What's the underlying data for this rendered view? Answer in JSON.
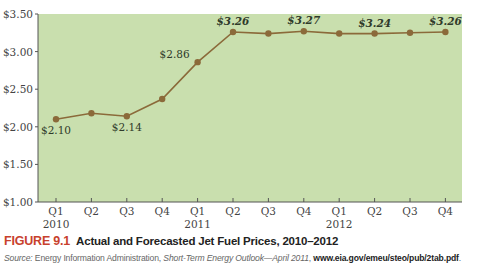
{
  "chart_data": {
    "type": "line",
    "title": "Actual and Forecasted Jet Fuel Prices, 2010–2012",
    "xlabel": "",
    "ylabel": "",
    "categories": [
      "Q1",
      "Q2",
      "Q3",
      "Q4",
      "Q1",
      "Q2",
      "Q3",
      "Q4",
      "Q1",
      "Q2",
      "Q3",
      "Q4"
    ],
    "year_labels": [
      {
        "index": 0,
        "label": "2010"
      },
      {
        "index": 4,
        "label": "2011"
      },
      {
        "index": 8,
        "label": "2012"
      }
    ],
    "series": [
      {
        "name": "Jet Fuel Price",
        "values": [
          2.1,
          2.18,
          2.14,
          2.37,
          2.86,
          3.26,
          3.24,
          3.27,
          3.24,
          3.24,
          3.25,
          3.26
        ]
      }
    ],
    "data_labels": [
      {
        "index": 0,
        "text": "$2.10",
        "position": "below",
        "bold": false
      },
      {
        "index": 2,
        "text": "$2.14",
        "position": "below",
        "bold": false
      },
      {
        "index": 4,
        "text": "$2.86",
        "position": "left",
        "bold": false
      },
      {
        "index": 5,
        "text": "$3.26",
        "position": "above",
        "bold": true
      },
      {
        "index": 7,
        "text": "$3.27",
        "position": "above",
        "bold": true
      },
      {
        "index": 9,
        "text": "$3.24",
        "position": "above",
        "bold": true
      },
      {
        "index": 11,
        "text": "$3.26",
        "position": "above",
        "bold": true
      }
    ],
    "yticks": [
      1.0,
      1.5,
      2.0,
      2.5,
      3.0,
      3.5
    ],
    "ytick_labels": [
      "$1.00",
      "$1.50",
      "$2.00",
      "$2.50",
      "$3.00",
      "$3.50"
    ],
    "ylim": [
      1.0,
      3.5
    ],
    "grid": false,
    "legend": "none",
    "colors": {
      "plot_bg": "#c9dfae",
      "line": "#8b6a3a",
      "marker": "#8b6a3a",
      "axis": "#555555"
    }
  },
  "caption": {
    "figure_label": "FIGURE 9.1",
    "title": "Actual and Forecasted Jet Fuel Prices, 2010–2012"
  },
  "source": {
    "prefix": "Source: ",
    "agency": "Energy Information Administration, ",
    "publication": "Short-Term Energy Outlook—April 2011",
    "sep": ", ",
    "url": "www.eia.gov/emeu/steo/pub/2tab.pdf",
    "suffix": "."
  }
}
